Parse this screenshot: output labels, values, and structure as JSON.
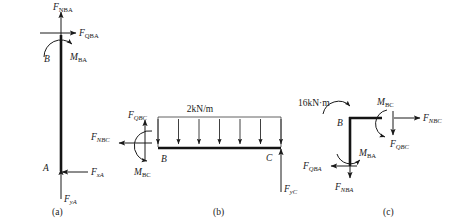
{
  "figure": {
    "type": "free-body-diagram",
    "panels": [
      {
        "id": "a",
        "caption": "(a)",
        "member": "column AB (vertical)",
        "joint_labels": [
          {
            "name": "B",
            "text": "B"
          },
          {
            "name": "A",
            "text": "A"
          }
        ],
        "forces": [
          {
            "name": "F-NBA",
            "symbol": "F",
            "subscript": "NBA",
            "direction": "up",
            "location": "top of column at B"
          },
          {
            "name": "F-QBA",
            "symbol": "F",
            "subscript": "QBA",
            "direction": "right",
            "location": "top of column at B"
          },
          {
            "name": "M-BA",
            "symbol": "M",
            "subscript": "BA",
            "direction": "counterclockwise",
            "location": "top of column at B"
          },
          {
            "name": "F-xA",
            "symbol": "F",
            "subscript": "xA",
            "direction": "left",
            "location": "base at A"
          },
          {
            "name": "F-yA",
            "symbol": "F",
            "subscript": "yA",
            "direction": "up",
            "location": "base at A"
          }
        ]
      },
      {
        "id": "b",
        "caption": "(b)",
        "member": "beam BC (horizontal)",
        "joint_labels": [
          {
            "name": "B",
            "text": "B"
          },
          {
            "name": "C",
            "text": "C"
          }
        ],
        "distributed_load": {
          "name": "uniform-load",
          "label": "2kN/m",
          "magnitude": 2,
          "unit": "kN/m",
          "direction": "downward",
          "arrow_count": 7
        },
        "forces": [
          {
            "name": "F-QBC",
            "symbol": "F",
            "subscript": "QBC",
            "direction": "up",
            "location": "left end at B"
          },
          {
            "name": "F-NBC",
            "symbol": "F",
            "subscript": "NBC",
            "direction": "left",
            "location": "left end at B"
          },
          {
            "name": "M-BC",
            "symbol": "M",
            "subscript": "BC",
            "direction": "clockwise",
            "location": "left end at B"
          },
          {
            "name": "F-yC",
            "symbol": "F",
            "subscript": "yC",
            "direction": "up",
            "location": "right end at C"
          }
        ]
      },
      {
        "id": "c",
        "caption": "(c)",
        "member": "joint B (rigid corner)",
        "joint_labels": [
          {
            "name": "B",
            "text": "B"
          }
        ],
        "applied_moment": {
          "name": "applied-moment",
          "label": "16kN·m",
          "magnitude": 16,
          "unit": "kN·m",
          "direction": "counterclockwise"
        },
        "forces": [
          {
            "name": "M-BC",
            "symbol": "M",
            "subscript": "BC",
            "direction": "counterclockwise",
            "location": "right stub"
          },
          {
            "name": "F-NBC",
            "symbol": "F",
            "subscript": "NBC",
            "direction": "right",
            "location": "right stub"
          },
          {
            "name": "F-QBC",
            "symbol": "F",
            "subscript": "QBC",
            "direction": "down",
            "location": "right stub"
          },
          {
            "name": "M-BA",
            "symbol": "M",
            "subscript": "BA",
            "direction": "clockwise",
            "location": "bottom stub"
          },
          {
            "name": "F-QBA",
            "symbol": "F",
            "subscript": "QBA",
            "direction": "left",
            "location": "bottom stub"
          },
          {
            "name": "F-NBA",
            "symbol": "F",
            "subscript": "NBA",
            "direction": "down",
            "location": "bottom stub"
          }
        ]
      }
    ]
  },
  "labels": {
    "F": "F",
    "M": "M",
    "B": "B",
    "A": "A",
    "C": "C",
    "NBA": "NBA",
    "QBA": "QBA",
    "BA": "BA",
    "xA": "xA",
    "yA": "yA",
    "QBC": "QBC",
    "NBC": "NBC",
    "BC": "BC",
    "yC": "yC",
    "load_2knm": "2kN/m",
    "moment_16knm": "16kN·m",
    "cap_a": "(a)",
    "cap_b": "(b)",
    "cap_c": "(c)"
  },
  "colors": {
    "ink": "#1a1a1a",
    "member": "#141414",
    "thin": "#3a3a3a",
    "background": "#ffffff"
  }
}
